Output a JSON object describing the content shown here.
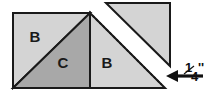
{
  "diagram": {
    "canvas": {
      "width": 217,
      "height": 94,
      "background": "#ffffff"
    },
    "colors": {
      "light_fabric": "#d4d4d4",
      "medium_fabric": "#a8a8a8",
      "outline": "#1a1a1a",
      "stitch_line": "#1a1a1a",
      "background": "#ffffff",
      "label_text": "#1a1a1a",
      "highlight": "#e8e8e8"
    },
    "pieces": [
      {
        "id": "piece-b-upper-left",
        "label": "B",
        "shade": "light",
        "shape": "triangle",
        "points": "13,13 90,13 13,88",
        "label_x": 35,
        "label_y": 38
      },
      {
        "id": "piece-c-center",
        "label": "C",
        "shade": "medium",
        "shape": "triangle",
        "points": "13,88 90,13 90,88",
        "label_x": 63,
        "label_y": 64
      },
      {
        "id": "piece-b-right",
        "label": "B",
        "shade": "light",
        "shape": "triangle",
        "points": "90,13 165,88 90,88",
        "label_x": 107,
        "label_y": 64
      },
      {
        "id": "piece-b-flipped-upper",
        "label": "",
        "shade": "light",
        "shape": "triangle",
        "points": "106,3 170,3 170,66",
        "label_x": 0,
        "label_y": 0
      }
    ],
    "stitch_line": {
      "id": "seam-stitch-line",
      "style": "dotted",
      "from_x": 93,
      "from_y": 16,
      "to_x": 161,
      "to_y": 84,
      "dash": "1.6 3.2",
      "width": 1.8
    },
    "annotation": {
      "id": "seam-allowance-callout",
      "arrow": {
        "tail_x": 203,
        "tail_y": 76,
        "head_x": 168,
        "head_y": 76
      },
      "measurement": "¼''",
      "numerator": "1",
      "denominator": "4",
      "unit_mark": "''",
      "text_x": 186,
      "text_y": 76
    }
  }
}
